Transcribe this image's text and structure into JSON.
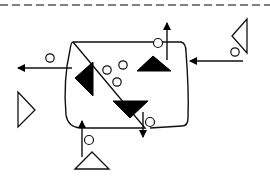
{
  "diagram": {
    "description": "Process/flow schematic: a rounded container holding filled triangles and small circles, with inflow and outflow arrows each marked by a small circle and associated outline triangles outside the container, beneath a dashed boundary line.",
    "colors": {
      "stroke": "#111111",
      "fill_solid": "#000000",
      "background": "#ffffff",
      "dashed_line": "#555555"
    },
    "boundary": {
      "type": "dashed-line",
      "y": 5
    },
    "container": {
      "shape": "rounded-rectangle",
      "bounds": [
        68,
        42,
        190,
        128
      ]
    },
    "internal_elements": [
      {
        "id": "left-filled-triangle",
        "type": "filled-triangle",
        "direction": "left"
      },
      {
        "id": "upper-filled-triangle",
        "type": "filled-triangle",
        "direction": "up"
      },
      {
        "id": "lower-filled-triangle",
        "type": "filled-triangle",
        "direction": "down"
      },
      {
        "id": "small-circle-1",
        "type": "circle"
      },
      {
        "id": "small-circle-2",
        "type": "circle"
      },
      {
        "id": "small-circle-3",
        "type": "circle"
      }
    ],
    "flows": [
      {
        "id": "outflow-left",
        "direction": "left",
        "marker": "circle"
      },
      {
        "id": "outflow-top",
        "direction": "up",
        "marker": "circle-on-edge"
      },
      {
        "id": "inflow-right",
        "direction": "left",
        "source": "right-outline-triangle",
        "marker": "circle"
      },
      {
        "id": "outflow-bottom",
        "direction": "down",
        "marker": "circle-on-edge"
      },
      {
        "id": "inflow-bottom",
        "direction": "up",
        "source": "bottom-outline-triangle",
        "marker": "circle"
      }
    ],
    "external_elements": [
      {
        "id": "right-outline-triangle",
        "type": "outline-triangle",
        "direction": "left"
      },
      {
        "id": "left-outline-triangle",
        "type": "outline-triangle",
        "direction": "right"
      },
      {
        "id": "bottom-outline-triangle",
        "type": "outline-triangle",
        "direction": "up"
      }
    ]
  }
}
